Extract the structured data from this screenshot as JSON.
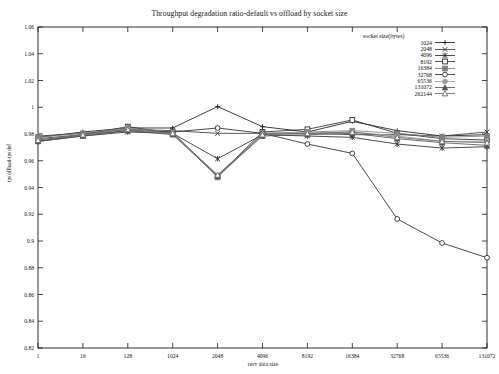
{
  "chart_data": {
    "type": "line",
    "title": "Throughput degradation ratio-default vs offload by socket size",
    "xlabel": "recv data size",
    "ylabel": "tps offload-tps def",
    "legend_title": "socket size(bytes)",
    "legend_position": "top-right",
    "grid": false,
    "ylim": [
      0.82,
      1.06
    ],
    "ytick_labels": [
      "0.82",
      "0.84",
      "0.86",
      "0.88",
      "0.9",
      "0.92",
      "0.94",
      "0.96",
      "0.98",
      "1",
      "1.02",
      "1.04",
      "1.06"
    ],
    "ytick_values": [
      0.82,
      0.84,
      0.86,
      0.88,
      0.9,
      0.92,
      0.94,
      0.96,
      0.98,
      1.0,
      1.02,
      1.04,
      1.06
    ],
    "categories": [
      "1",
      "16",
      "128",
      "1024",
      "2048",
      "4096",
      "8192",
      "16384",
      "32768",
      "65536",
      "131072"
    ],
    "x_positions": [
      0,
      1,
      2,
      3,
      4,
      5,
      6,
      7,
      8,
      9,
      10
    ],
    "series": [
      {
        "name": "1024",
        "marker": "plus",
        "color": "#1a1a1a",
        "values": [
          0.9775,
          0.9815,
          0.9845,
          0.9845,
          1.0005,
          0.9855,
          0.9815,
          0.9895,
          0.9825,
          0.9785,
          0.9795
        ]
      },
      {
        "name": "2048",
        "marker": "cross",
        "color": "#3a3a3a",
        "values": [
          0.9785,
          0.9805,
          0.9835,
          0.9825,
          0.9805,
          0.9805,
          0.9805,
          0.9795,
          0.9795,
          0.9785,
          0.9815
        ]
      },
      {
        "name": "4096",
        "marker": "asterisk",
        "color": "#2a2a2a",
        "values": [
          0.9745,
          0.9785,
          0.9815,
          0.9805,
          0.9615,
          0.9795,
          0.9785,
          0.9775,
          0.9725,
          0.9695,
          0.9705
        ]
      },
      {
        "name": "8192",
        "marker": "square-open",
        "color": "#2a2a2a",
        "values": [
          0.9765,
          0.9795,
          0.9855,
          0.9805,
          0.9485,
          0.9815,
          0.9835,
          0.9905,
          0.9805,
          0.9765,
          0.9755
        ]
      },
      {
        "name": "16384",
        "marker": "square-filled",
        "color": "#808080",
        "values": [
          0.9775,
          0.9805,
          0.9845,
          0.9815,
          0.9475,
          0.9805,
          0.9815,
          0.9825,
          0.9805,
          0.9775,
          0.9785
        ]
      },
      {
        "name": "32768",
        "marker": "circle-open",
        "color": "#2a2a2a",
        "values": [
          0.9745,
          0.9795,
          0.9825,
          0.9815,
          0.9845,
          0.9805,
          0.9725,
          0.9655,
          0.9165,
          0.8985,
          0.8875
        ]
      },
      {
        "name": "65536",
        "marker": "circle-filled",
        "color": "#9a9a9a",
        "values": [
          0.9755,
          0.9795,
          0.9835,
          0.9805,
          0.9485,
          0.9795,
          0.9805,
          0.9815,
          0.9785,
          0.9745,
          0.9745
        ]
      },
      {
        "name": "131072",
        "marker": "triangle-filled",
        "color": "#555555",
        "values": [
          0.9745,
          0.9785,
          0.9825,
          0.9795,
          0.9485,
          0.9785,
          0.9795,
          0.9805,
          0.9765,
          0.9735,
          0.9715
        ]
      },
      {
        "name": "262144",
        "marker": "triangle-open",
        "color": "#6a6a6a",
        "values": [
          0.9755,
          0.9795,
          0.9835,
          0.9805,
          0.9495,
          0.9795,
          0.9805,
          0.9815,
          0.9775,
          0.9745,
          0.9735
        ]
      }
    ]
  },
  "colors": {
    "axis": "#1a1a1a",
    "background": "#ffffff",
    "text": "#111111"
  }
}
